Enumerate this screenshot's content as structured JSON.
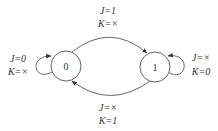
{
  "diagram": {
    "type": "state-transition",
    "states": [
      {
        "id": "s0",
        "label": "0"
      },
      {
        "id": "s1",
        "label": "1"
      }
    ],
    "transitions": [
      {
        "from": "s0",
        "to": "s0",
        "label_line1": "J=0",
        "label_line2": "K=×"
      },
      {
        "from": "s0",
        "to": "s1",
        "label_line1": "J=1",
        "label_line2": "K=×"
      },
      {
        "from": "s1",
        "to": "s1",
        "label_line1": "J=×",
        "label_line2": "K=0"
      },
      {
        "from": "s1",
        "to": "s0",
        "label_line1": "J=×",
        "label_line2": "K=1"
      }
    ]
  }
}
